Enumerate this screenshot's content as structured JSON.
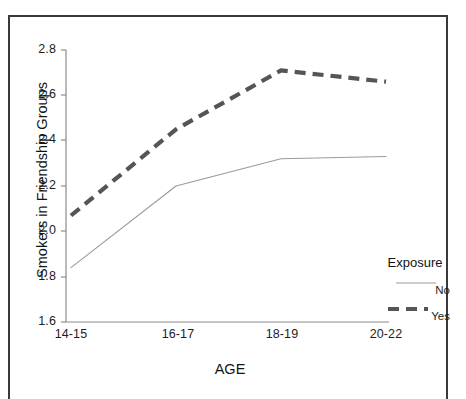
{
  "chart_data": {
    "type": "line",
    "title": "",
    "xlabel": "AGE",
    "ylabel": "Smokers in Friendship Groups",
    "categories": [
      "14-15",
      "16-17",
      "18-19",
      "20-22"
    ],
    "ylim": [
      1.6,
      2.8
    ],
    "yticks": [
      "1.6",
      "1.8",
      "2.0",
      "2.2",
      "2.4",
      "2.6",
      "2.8"
    ],
    "ytick_values": [
      1.6,
      1.8,
      2.0,
      2.2,
      2.4,
      2.6,
      2.8
    ],
    "grid": false,
    "legend": {
      "title": "Exposure",
      "position": "right",
      "entries": [
        {
          "label": "No",
          "style": "solid-thin",
          "color": "#9a9a9a"
        },
        {
          "label": "Yes",
          "style": "dashed-thick",
          "color": "#555555"
        }
      ]
    },
    "series": [
      {
        "name": "No",
        "style": "solid-thin",
        "color": "#9a9a9a",
        "values": [
          1.84,
          2.2,
          2.32,
          2.33
        ]
      },
      {
        "name": "Yes",
        "style": "dashed-thick",
        "color": "#555555",
        "values": [
          2.07,
          2.45,
          2.71,
          2.66
        ]
      }
    ]
  },
  "axis": {
    "ytick_labels": [
      "2.8",
      "2.6",
      "2.4",
      "2.2",
      "2.0",
      "1.8",
      "1.6"
    ],
    "xtick_labels": [
      "14-15",
      "16-17",
      "18-19",
      "20-22"
    ]
  },
  "labels": {
    "y_axis_title": "Smokers in Friendship Groups",
    "x_axis_title": "AGE"
  },
  "legend": {
    "title": "Exposure",
    "no_label": "No",
    "yes_label": "Yes"
  },
  "colors": {
    "frame": "#3a3a3a",
    "axis": "#8c8c8c",
    "series_no": "#9a9a9a",
    "series_yes": "#555555",
    "text": "#1a1a1a",
    "background": "#ffffff"
  }
}
